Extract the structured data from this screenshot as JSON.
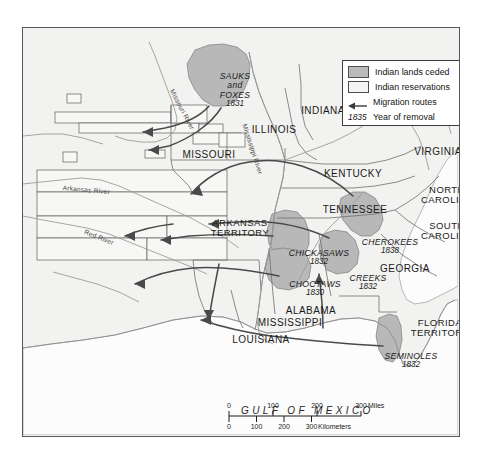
{
  "map": {
    "title_visible": false,
    "background_color": "#f2f2f0",
    "land_color": "#f2f2f0",
    "ceded_color": "#b9b9b9",
    "reservation_color": "#f4f4f2",
    "border_color": "#58585a"
  },
  "legend": {
    "items": [
      {
        "kind": "swatch-ceded",
        "label": "Indian lands ceded"
      },
      {
        "kind": "swatch-resv",
        "label": "Indian reservations"
      },
      {
        "kind": "arrow",
        "label": "Migration routes"
      },
      {
        "kind": "year",
        "key": "1835",
        "label": "Year of removal"
      }
    ]
  },
  "states": [
    {
      "name": "INDIANA",
      "x": 300,
      "y": 83
    },
    {
      "name": "ILLINOIS",
      "x": 251,
      "y": 102
    },
    {
      "name": "MISSOURI",
      "x": 186,
      "y": 127
    },
    {
      "name": "VIRGINIA",
      "x": 415,
      "y": 124
    },
    {
      "name": "KENTUCKY",
      "x": 330,
      "y": 146
    },
    {
      "name": "TENNESSEE",
      "x": 332,
      "y": 182
    },
    {
      "name": "NORTH\nCAROLINA",
      "x": 424,
      "y": 167
    },
    {
      "name": "SOUTH\nCAROLINA",
      "x": 424,
      "y": 203
    },
    {
      "name": "ARKANSAS\nTERRITORY",
      "x": 217,
      "y": 200
    },
    {
      "name": "GEORGIA",
      "x": 382,
      "y": 241
    },
    {
      "name": "ALABAMA",
      "x": 288,
      "y": 283
    },
    {
      "name": "MISSISSIPPI",
      "x": 267,
      "y": 295
    },
    {
      "name": "LOUISIANA",
      "x": 238,
      "y": 312
    },
    {
      "name": "FLORIDA\nTERRITORY",
      "x": 417,
      "y": 300
    }
  ],
  "tribes": [
    {
      "name": "SAUKS\nand\nFOXES",
      "year": "1831",
      "x": 212,
      "y": 62
    },
    {
      "name": "CHICKASAWS",
      "year": "1832",
      "x": 296,
      "y": 230
    },
    {
      "name": "CHOCTAWS",
      "year": "1830",
      "x": 292,
      "y": 261
    },
    {
      "name": "CHEROKEES",
      "year": "1838",
      "x": 367,
      "y": 219
    },
    {
      "name": "CREEKS",
      "year": "1832",
      "x": 345,
      "y": 255
    },
    {
      "name": "SEMINOLES",
      "year": "1832",
      "x": 388,
      "y": 333
    }
  ],
  "rivers": [
    {
      "name": "Missouri River",
      "x": 152,
      "y": 60,
      "rotate": 62
    },
    {
      "name": "Mississippi River",
      "x": 225,
      "y": 95,
      "rotate": 72
    },
    {
      "name": "Arkansas River",
      "x": 40,
      "y": 156,
      "rotate": 5
    },
    {
      "name": "Red River",
      "x": 63,
      "y": 200,
      "rotate": 22
    }
  ],
  "water_label": {
    "name": "GULF OF MEXICO",
    "x": 218,
    "y": 378
  },
  "scale": {
    "miles": {
      "unit": "Miles",
      "ticks": [
        "0",
        "100",
        "200",
        "300"
      ],
      "tick_px": [
        0,
        44,
        88,
        132
      ]
    },
    "kilometers": {
      "unit": "Kilometers",
      "ticks": [
        "0",
        "100",
        "200",
        "300"
      ],
      "tick_px": [
        0,
        27.5,
        55,
        82.5
      ]
    }
  }
}
